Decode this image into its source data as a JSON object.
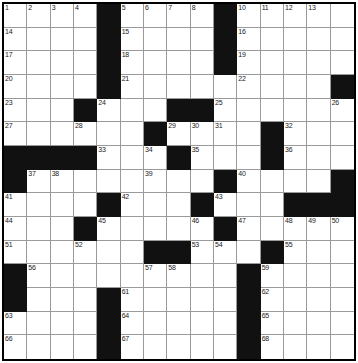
{
  "puzzle": {
    "type": "crossword-grid",
    "rows": 15,
    "columns": 15,
    "colors": {
      "block": "#111111",
      "cell": "#ffffff",
      "gridline": "#9a9a9a",
      "border": "#000000",
      "number_text": "#1a1a1a"
    },
    "blocks": [
      [
        0,
        4
      ],
      [
        0,
        9
      ],
      [
        1,
        4
      ],
      [
        1,
        9
      ],
      [
        2,
        4
      ],
      [
        2,
        9
      ],
      [
        3,
        4
      ],
      [
        3,
        14
      ],
      [
        4,
        3
      ],
      [
        4,
        7
      ],
      [
        4,
        8
      ],
      [
        5,
        6
      ],
      [
        5,
        11
      ],
      [
        6,
        0
      ],
      [
        6,
        1
      ],
      [
        6,
        2
      ],
      [
        6,
        3
      ],
      [
        6,
        7
      ],
      [
        6,
        11
      ],
      [
        7,
        0
      ],
      [
        7,
        9
      ],
      [
        7,
        14
      ],
      [
        8,
        4
      ],
      [
        8,
        8
      ],
      [
        8,
        12
      ],
      [
        8,
        13
      ],
      [
        8,
        14
      ],
      [
        9,
        3
      ],
      [
        9,
        9
      ],
      [
        10,
        6
      ],
      [
        10,
        7
      ],
      [
        10,
        11
      ],
      [
        11,
        0
      ],
      [
        11,
        10
      ],
      [
        12,
        0
      ],
      [
        12,
        4
      ],
      [
        12,
        10
      ],
      [
        13,
        4
      ],
      [
        13,
        10
      ],
      [
        14,
        4
      ],
      [
        14,
        10
      ]
    ],
    "numbers": [
      {
        "row": 0,
        "col": 0,
        "n": "1"
      },
      {
        "row": 0,
        "col": 1,
        "n": "2"
      },
      {
        "row": 0,
        "col": 2,
        "n": "3"
      },
      {
        "row": 0,
        "col": 3,
        "n": "4"
      },
      {
        "row": 0,
        "col": 5,
        "n": "5"
      },
      {
        "row": 0,
        "col": 6,
        "n": "6"
      },
      {
        "row": 0,
        "col": 7,
        "n": "7"
      },
      {
        "row": 0,
        "col": 8,
        "n": "8"
      },
      {
        "row": 0,
        "col": 9,
        "n": "9"
      },
      {
        "row": 0,
        "col": 10,
        "n": "10"
      },
      {
        "row": 0,
        "col": 11,
        "n": "11"
      },
      {
        "row": 0,
        "col": 12,
        "n": "12"
      },
      {
        "row": 0,
        "col": 13,
        "n": "13"
      },
      {
        "row": 1,
        "col": 0,
        "n": "14"
      },
      {
        "row": 1,
        "col": 5,
        "n": "15"
      },
      {
        "row": 1,
        "col": 10,
        "n": "16"
      },
      {
        "row": 2,
        "col": 0,
        "n": "17"
      },
      {
        "row": 2,
        "col": 5,
        "n": "18"
      },
      {
        "row": 2,
        "col": 10,
        "n": "19"
      },
      {
        "row": 3,
        "col": 0,
        "n": "20"
      },
      {
        "row": 3,
        "col": 5,
        "n": "21"
      },
      {
        "row": 3,
        "col": 10,
        "n": "22"
      },
      {
        "row": 4,
        "col": 0,
        "n": "23"
      },
      {
        "row": 4,
        "col": 4,
        "n": "24"
      },
      {
        "row": 4,
        "col": 9,
        "n": "25"
      },
      {
        "row": 4,
        "col": 14,
        "n": "26"
      },
      {
        "row": 5,
        "col": 0,
        "n": "27"
      },
      {
        "row": 5,
        "col": 3,
        "n": "28"
      },
      {
        "row": 5,
        "col": 7,
        "n": "29"
      },
      {
        "row": 5,
        "col": 8,
        "n": "30"
      },
      {
        "row": 5,
        "col": 9,
        "n": "31"
      },
      {
        "row": 5,
        "col": 12,
        "n": "32"
      },
      {
        "row": 6,
        "col": 4,
        "n": "33"
      },
      {
        "row": 6,
        "col": 6,
        "n": "34"
      },
      {
        "row": 6,
        "col": 8,
        "n": "35"
      },
      {
        "row": 6,
        "col": 12,
        "n": "36"
      },
      {
        "row": 7,
        "col": 1,
        "n": "37"
      },
      {
        "row": 7,
        "col": 2,
        "n": "38"
      },
      {
        "row": 7,
        "col": 6,
        "n": "39"
      },
      {
        "row": 7,
        "col": 10,
        "n": "40"
      },
      {
        "row": 8,
        "col": 0,
        "n": "41"
      },
      {
        "row": 8,
        "col": 5,
        "n": "42"
      },
      {
        "row": 8,
        "col": 9,
        "n": "43"
      },
      {
        "row": 9,
        "col": 0,
        "n": "44"
      },
      {
        "row": 9,
        "col": 4,
        "n": "45"
      },
      {
        "row": 9,
        "col": 8,
        "n": "46"
      },
      {
        "row": 9,
        "col": 10,
        "n": "47"
      },
      {
        "row": 9,
        "col": 12,
        "n": "48"
      },
      {
        "row": 9,
        "col": 13,
        "n": "49"
      },
      {
        "row": 9,
        "col": 14,
        "n": "50"
      },
      {
        "row": 10,
        "col": 0,
        "n": "51"
      },
      {
        "row": 10,
        "col": 3,
        "n": "52"
      },
      {
        "row": 10,
        "col": 8,
        "n": "53"
      },
      {
        "row": 10,
        "col": 9,
        "n": "54"
      },
      {
        "row": 10,
        "col": 12,
        "n": "55"
      },
      {
        "row": 11,
        "col": 1,
        "n": "56"
      },
      {
        "row": 11,
        "col": 6,
        "n": "57"
      },
      {
        "row": 11,
        "col": 7,
        "n": "58"
      },
      {
        "row": 11,
        "col": 11,
        "n": "59"
      },
      {
        "row": 12,
        "col": 0,
        "n": "60"
      },
      {
        "row": 12,
        "col": 5,
        "n": "61"
      },
      {
        "row": 12,
        "col": 11,
        "n": "62"
      },
      {
        "row": 13,
        "col": 0,
        "n": "63"
      },
      {
        "row": 13,
        "col": 5,
        "n": "64"
      },
      {
        "row": 13,
        "col": 11,
        "n": "65"
      },
      {
        "row": 14,
        "col": 0,
        "n": "66"
      },
      {
        "row": 14,
        "col": 5,
        "n": "67"
      },
      {
        "row": 14,
        "col": 11,
        "n": "68"
      }
    ]
  }
}
